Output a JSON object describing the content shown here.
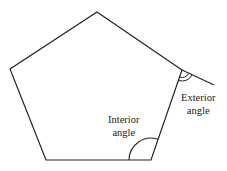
{
  "diagram": {
    "stroke_color": "#222222",
    "background": "#ffffff",
    "vertices": [
      {
        "x": 97,
        "y": 12
      },
      {
        "x": 182,
        "y": 70
      },
      {
        "x": 151,
        "y": 160
      },
      {
        "x": 46,
        "y": 160
      },
      {
        "x": 10,
        "y": 69
      }
    ],
    "extension_line": {
      "from": {
        "x": 182,
        "y": 70
      },
      "to": {
        "x": 214,
        "y": 85
      }
    },
    "labels": {
      "exterior": {
        "line1": "Exterior",
        "line2": "angle"
      },
      "interior": {
        "line1": "Interior",
        "line2": "angle"
      }
    }
  }
}
